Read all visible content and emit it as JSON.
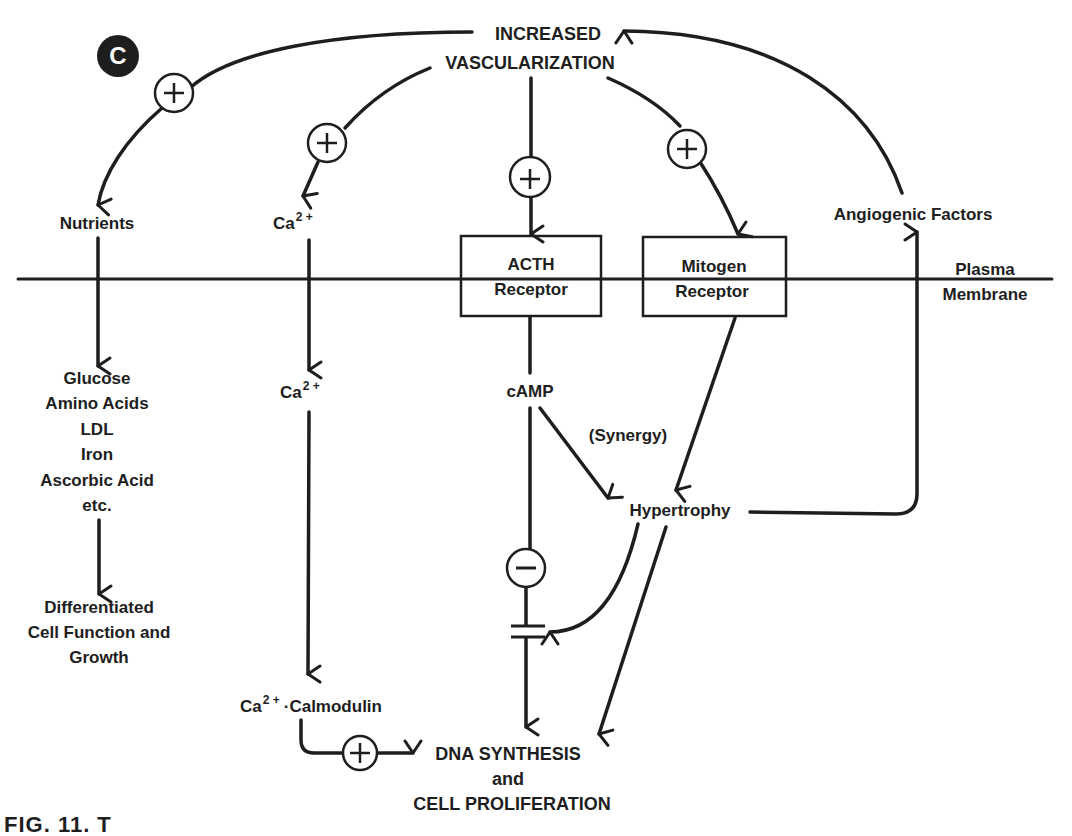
{
  "figure": {
    "panel_label": "C",
    "caption_partial": "FIG. 11. T"
  },
  "nodes": {
    "top": [
      "INCREASED",
      "VASCULARIZATION"
    ],
    "nutrients": "Nutrients",
    "ca_outer": {
      "base": "Ca",
      "sup": "2 +"
    },
    "acth_receptor": [
      "ACTH",
      "Receptor"
    ],
    "mitogen_receptor": [
      "Mitogen",
      "Receptor"
    ],
    "angiogenic_factors": "Angiogenic Factors",
    "plasma_membrane": [
      "Plasma",
      "Membrane"
    ],
    "nutrient_list": [
      "Glucose",
      "Amino Acids",
      "LDL",
      "Iron",
      "Ascorbic Acid",
      "etc."
    ],
    "differentiated": [
      "Differentiated",
      "Cell Function and",
      "Growth"
    ],
    "ca_inner": {
      "base": "Ca",
      "sup": "2 +"
    },
    "camp": "cAMP",
    "synergy": "(Synergy)",
    "hypertrophy": "Hypertrophy",
    "calmodulin": {
      "base": "Ca",
      "sup": "2 +",
      "rest": "·Calmodulin"
    },
    "output": [
      "DNA SYNTHESIS",
      "and",
      "CELL PROLIFERATION"
    ]
  },
  "symbols": {
    "plus": "+",
    "minus": "−"
  },
  "colors": {
    "ink": "#1e1e1e",
    "background": "#ffffff"
  }
}
